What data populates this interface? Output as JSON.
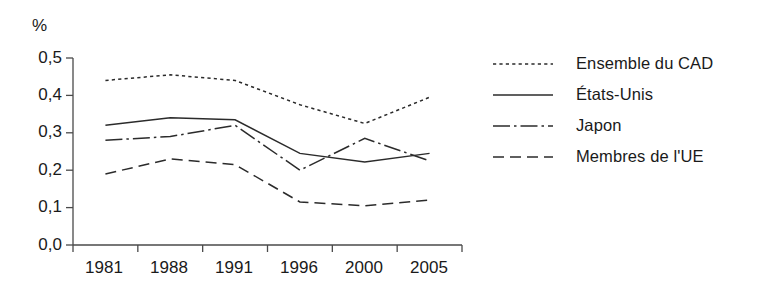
{
  "chart_data": {
    "type": "line",
    "title": "",
    "subtitle": "",
    "xlabel": "",
    "ylabel": "%",
    "unit_label": "%",
    "categories": [
      "1981",
      "1988",
      "1991",
      "1996",
      "2000",
      "2005"
    ],
    "ylim": [
      0.0,
      0.5
    ],
    "ytick_labels": [
      "0,0",
      "0,1",
      "0,2",
      "0,3",
      "0,4",
      "0,5"
    ],
    "ytick_values": [
      0.0,
      0.1,
      0.2,
      0.3,
      0.4,
      0.5
    ],
    "grid": false,
    "legend_position": "right",
    "series": [
      {
        "name": "Ensemble du CAD",
        "style": "dotted",
        "color": "#2b2b2b",
        "values": [
          0.44,
          0.455,
          0.44,
          0.375,
          0.325,
          0.395
        ]
      },
      {
        "name": "États-Unis",
        "style": "solid",
        "color": "#2b2b2b",
        "values": [
          0.32,
          0.34,
          0.335,
          0.245,
          0.222,
          0.245
        ]
      },
      {
        "name": "Japon",
        "style": "dashdot",
        "color": "#2b2b2b",
        "values": [
          0.28,
          0.29,
          0.32,
          0.2,
          0.285,
          0.225
        ]
      },
      {
        "name": "Membres de l'UE",
        "style": "dashed",
        "color": "#2b2b2b",
        "values": [
          0.19,
          0.23,
          0.215,
          0.115,
          0.105,
          0.12
        ]
      }
    ]
  },
  "legend": {
    "items": [
      {
        "label": "Ensemble du CAD",
        "style": "dotted"
      },
      {
        "label": "États-Unis",
        "style": "solid"
      },
      {
        "label": "Japon",
        "style": "dashdot"
      },
      {
        "label": "Membres de l'UE",
        "style": "dashed"
      }
    ]
  },
  "colors": {
    "ink": "#2b2b2b",
    "axis": "#4a4a4a",
    "background": "#ffffff"
  }
}
